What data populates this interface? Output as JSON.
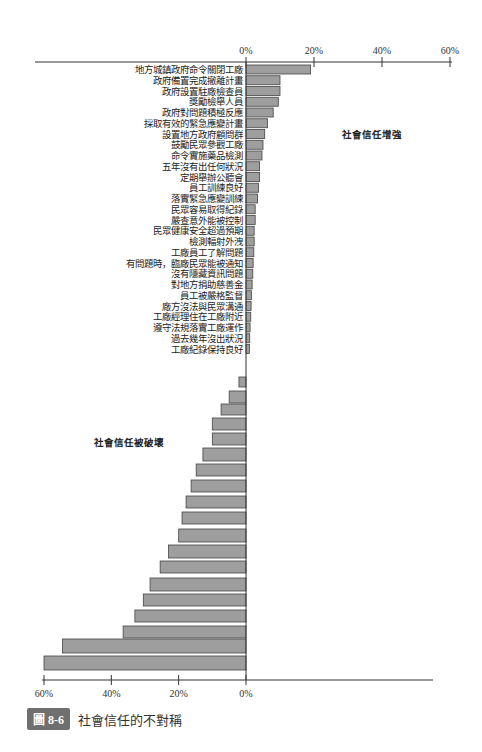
{
  "figure": {
    "badge": "圖 8-6",
    "title": "社會信任的不對稱"
  },
  "colors": {
    "bar_fill": "#9e9e9e",
    "bar_stroke": "#444444",
    "axis": "#333333",
    "badge_bg": "#6f6f6f"
  },
  "chart_data": {
    "type": "bar",
    "orientation": "horizontal",
    "title": "社會信任的不對稱",
    "annotations": [
      {
        "text": "社會信任增強",
        "x_pct": 25,
        "near": "top-right"
      },
      {
        "text": "社會信任被破壞",
        "x_pct": -40,
        "near": "middle-left"
      }
    ],
    "top_axis": {
      "ticks": [
        "0%",
        "20%",
        "40%",
        "60%"
      ],
      "range": [
        0,
        60
      ]
    },
    "bottom_axis": {
      "ticks": [
        "60%",
        "40%",
        "20%",
        "0%"
      ],
      "range": [
        -60,
        0
      ]
    },
    "grid": false,
    "series": [
      {
        "name": "社會信任增強",
        "categories": [
          "地方城鎮政府命令關閉工廠",
          "政府備置完成撤離計畫",
          "政府設置駐廠檢查員",
          "獎勵檢舉人員",
          "政府對問題積極反應",
          "採取有效的緊急應變計畫",
          "設置地方政府顧問群",
          "鼓勵民眾參觀工廠",
          "命令實施藥品檢測",
          "五年沒有出任何狀況",
          "定期舉辦公聽會",
          "員工訓練良好",
          "落實緊急應變訓練",
          "民眾容易取得紀錄",
          "嚴查意外能被控制",
          "民眾健康安全超過預期",
          "檢測輻射外洩",
          "工廠員工了解問題",
          "有問題時，臨廠民眾能被通知",
          "沒有隱藏資訊問題",
          "對地方捐助慈善金",
          "員工被嚴格監督",
          "廠方沒法與民眾溝通",
          "工廠經理住在工廠附近",
          "遵守法規落實工廠運作",
          "過去幾年沒出狀況",
          "工廠紀錄保持良好"
        ],
        "values": [
          19,
          10,
          10,
          9.5,
          8,
          6.3,
          5.5,
          5,
          4.7,
          4,
          4,
          3.7,
          3.4,
          2.7,
          2.7,
          2.4,
          2.4,
          2.3,
          2.1,
          2,
          1.8,
          1.6,
          1.5,
          1.4,
          1.2,
          1.1,
          1
        ]
      },
      {
        "name": "社會信任被破壞",
        "categories": [
          "",
          "",
          "",
          "",
          "",
          "",
          "",
          "",
          "",
          "",
          "",
          "",
          "",
          "",
          "",
          "",
          "",
          "",
          ""
        ],
        "values": [
          -2.1,
          -5,
          -7.4,
          -10,
          -10,
          -12.8,
          -14.8,
          -16.3,
          -17.8,
          -19,
          -20,
          -23,
          -25.5,
          -28.5,
          -30.5,
          -33,
          -36.5,
          -54.5,
          -60
        ]
      }
    ]
  }
}
